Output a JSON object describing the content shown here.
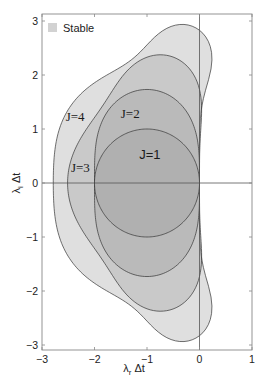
{
  "chart_data": {
    "type": "area",
    "title": "",
    "xlabel": "λ_r Δt",
    "ylabel": "λ_i Δt",
    "xlim": [
      -3,
      1
    ],
    "ylim": [
      -3.1,
      3.1
    ],
    "xticks": [
      -3,
      -2,
      -1,
      0,
      1
    ],
    "yticks": [
      -3,
      -2,
      -1,
      0,
      1,
      2,
      3
    ],
    "grid": false,
    "reference_lines": {
      "x": 0,
      "y": 0
    },
    "legend": {
      "position": "upper-left",
      "entries": [
        {
          "label": "Stable",
          "color": "#d2d2d2"
        }
      ]
    },
    "series": [
      {
        "name": "J=4",
        "order": 4,
        "description": "|sum_{k=0..4} z^k/k!| <= 1",
        "real_intercept": -2.785,
        "imag_axis_extent": 2.83,
        "label_pos": [
          -2.55,
          1.15
        ],
        "label_font": "serif"
      },
      {
        "name": "J=3",
        "order": 3,
        "description": "|sum_{k=0..3} z^k/k!| <= 1",
        "real_intercept": -2.51,
        "imag_axis_extent": 1.73,
        "label_pos": [
          -2.45,
          0.2
        ],
        "label_font": "serif"
      },
      {
        "name": "J=2",
        "order": 2,
        "description": "|1 + z + z^2/2| <= 1",
        "real_intercept": -2.0,
        "imag_axis_extent": 0.0,
        "label_pos": [
          -1.5,
          1.2
        ],
        "label_font": "serif"
      },
      {
        "name": "J=1",
        "order": 1,
        "description": "|1 + z| <= 1 (circle center -1, radius 1)",
        "real_intercept": -2.0,
        "imag_axis_extent": 0.0,
        "label_pos": [
          -1.15,
          0.45
        ],
        "label_font": "sans"
      }
    ],
    "region_fill": "#9a9a9a",
    "region_fill_opacity": 0.32,
    "region_stroke": "#333333"
  },
  "axes": {
    "x_tick_labels": [
      "−3",
      "−2",
      "−1",
      "0",
      "1"
    ],
    "y_tick_labels": [
      "−3",
      "−2",
      "−1",
      "0",
      "1",
      "2",
      "3"
    ],
    "xlabel_main": "λ",
    "xlabel_sub": "r",
    "xlabel_tail": " Δt",
    "ylabel_main": "λ",
    "ylabel_sub": "i",
    "ylabel_tail": " Δt"
  },
  "legend": {
    "label": "Stable"
  },
  "labels": {
    "j1": "J=1",
    "j2": "J=2",
    "j3": "J=3",
    "j4": "J=4"
  }
}
